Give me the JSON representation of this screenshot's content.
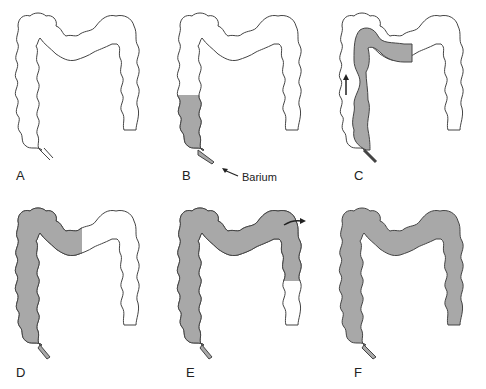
{
  "figure": {
    "fill_color": "#a8a8a8",
    "outline_color": "#444444",
    "panels": [
      {
        "id": "A",
        "label": "A",
        "filled": "none"
      },
      {
        "id": "B",
        "label": "B",
        "filled": "rectum and lower descending colon",
        "annotation": "Barium"
      },
      {
        "id": "C",
        "label": "C",
        "filled": "descending colon to splenic flexure and left transverse",
        "arrow": "up"
      },
      {
        "id": "D",
        "label": "D",
        "filled": "descending colon and left half of transverse colon"
      },
      {
        "id": "E",
        "label": "E",
        "filled": "descending, transverse, hepatic flexure and upper ascending colon",
        "arrow": "right-curved"
      },
      {
        "id": "F",
        "label": "F",
        "filled": "entire colon"
      }
    ]
  }
}
